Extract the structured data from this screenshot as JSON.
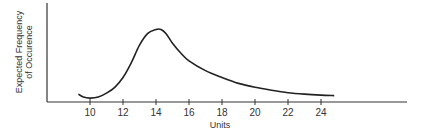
{
  "chart_data": {
    "type": "line",
    "title": "",
    "xlabel": "Units",
    "ylabel_line1": "Expected Frequency",
    "ylabel_line2": "of Occurence",
    "x_ticks": [
      10,
      12,
      14,
      16,
      18,
      20,
      22,
      24
    ],
    "x_tick_labels": [
      "10",
      "12",
      "14",
      "16",
      "18",
      "20",
      "22",
      "24"
    ],
    "xlim": [
      7.4,
      30
    ],
    "ylim": [
      0,
      1
    ],
    "grid": false,
    "legend": null,
    "series": [
      {
        "name": "Expected Frequency",
        "x": [
          9.3,
          9.6,
          10.0,
          10.5,
          11.0,
          11.5,
          12.0,
          12.5,
          13.0,
          13.5,
          14.0,
          14.3,
          14.6,
          15.0,
          15.5,
          16.0,
          17.0,
          18.0,
          19.0,
          20.0,
          21.0,
          22.0,
          23.0,
          24.0,
          24.8
        ],
        "y": [
          0.08,
          0.05,
          0.04,
          0.05,
          0.09,
          0.15,
          0.25,
          0.4,
          0.58,
          0.7,
          0.74,
          0.74,
          0.7,
          0.6,
          0.5,
          0.42,
          0.32,
          0.25,
          0.19,
          0.15,
          0.12,
          0.095,
          0.08,
          0.07,
          0.065
        ]
      }
    ]
  }
}
